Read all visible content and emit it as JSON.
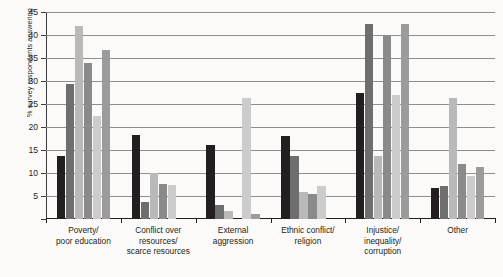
{
  "chart_data": {
    "type": "bar",
    "title": "",
    "xlabel": "",
    "ylabel": "% survey respondents answering",
    "ylim": [
      0,
      45
    ],
    "yticks": [
      5,
      10,
      15,
      20,
      25,
      30,
      35,
      40,
      45
    ],
    "grid": true,
    "legend_position": "none",
    "categories": [
      "Poverty/\npoor education",
      "Conflict over\nresources/\nscarce resources",
      "External\naggression",
      "Ethnic conflict/\nreligion",
      "Injustice/\ninequality/\ncorruption",
      "Other"
    ],
    "category_lines": [
      [
        "Poverty/",
        "poor education"
      ],
      [
        "Conflict over",
        "resources/",
        "scarce resources"
      ],
      [
        "External",
        "aggression"
      ],
      [
        "Ethnic conflict/",
        "religion"
      ],
      [
        "Injustice/",
        "inequality/",
        "corruption"
      ],
      [
        "Other"
      ]
    ],
    "series": [
      {
        "name": "Series 1",
        "color": "#231f20",
        "values": [
          13.7,
          18.3,
          16.0,
          18.0,
          27.5,
          6.7
        ]
      },
      {
        "name": "Series 2",
        "color": "#6e6e6e",
        "values": [
          29.3,
          3.8,
          3.0,
          13.8,
          42.4,
          7.2
        ]
      },
      {
        "name": "Series 3",
        "color": "#b9b9b9",
        "values": [
          42.0,
          10.0,
          1.7,
          5.8,
          13.8,
          26.3
        ]
      },
      {
        "name": "Series 4",
        "color": "#8a8a8a",
        "values": [
          34.0,
          7.7,
          0.0,
          5.5,
          39.7,
          12.0
        ]
      },
      {
        "name": "Series 5",
        "color": "#cccccc",
        "values": [
          22.3,
          7.5,
          26.3,
          7.2,
          27.0,
          9.3
        ]
      },
      {
        "name": "Series 6",
        "color": "#9b9b9b",
        "values": [
          36.7,
          0.0,
          1.0,
          0.0,
          42.4,
          11.2
        ]
      }
    ]
  },
  "axis": {
    "y_title": "% survey respondents answering",
    "y_tick_labels": [
      "45",
      "40",
      "35",
      "30",
      "25",
      "20",
      "15",
      "10",
      "5"
    ]
  }
}
